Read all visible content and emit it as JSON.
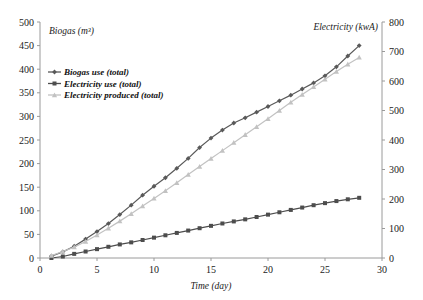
{
  "chart_data": {
    "type": "line",
    "title": "",
    "xlabel": "Time (day)",
    "ylabel": "Biogas (m³)",
    "ylabel_right": "Electricity (kwA)",
    "xlim": [
      0,
      30
    ],
    "ylim": [
      0,
      500
    ],
    "ylim_right": [
      0,
      800
    ],
    "xticks": [
      0,
      5,
      10,
      15,
      20,
      25,
      30
    ],
    "yticks": [
      0,
      50,
      100,
      150,
      200,
      250,
      300,
      350,
      400,
      450,
      500
    ],
    "yticks_right": [
      0,
      100,
      200,
      300,
      400,
      500,
      600,
      700,
      800
    ],
    "grid": false,
    "legend_position": "upper-left",
    "x": [
      1,
      2,
      3,
      4,
      5,
      6,
      7,
      8,
      9,
      10,
      11,
      12,
      13,
      14,
      15,
      16,
      17,
      18,
      19,
      20,
      21,
      22,
      23,
      24,
      25,
      26,
      27,
      28
    ],
    "series": [
      {
        "name": "Biogas use (total)",
        "axis": "left",
        "unit": "m³",
        "color": "#595959",
        "marker": "diamond",
        "values": [
          4,
          13,
          25,
          40,
          56,
          73,
          92,
          112,
          133,
          152,
          170,
          190,
          211,
          234,
          254,
          271,
          286,
          297,
          309,
          321,
          333,
          345,
          358,
          371,
          386,
          405,
          428,
          450
        ]
      },
      {
        "name": "Electricity use (total)",
        "axis": "right",
        "unit": "kwA",
        "color": "#4d4d4d",
        "marker": "square",
        "values": [
          0,
          5,
          14,
          22,
          30,
          38,
          46,
          53,
          61,
          69,
          77,
          85,
          93,
          101,
          109,
          117,
          124,
          131,
          139,
          147,
          155,
          163,
          171,
          179,
          186,
          193,
          199,
          204
        ]
      },
      {
        "name": "Electricity produced (total)",
        "axis": "right",
        "unit": "kwA",
        "color": "#c2c2c2",
        "marker": "triangle",
        "values": [
          8,
          22,
          37,
          56,
          78,
          101,
          125,
          150,
          176,
          202,
          228,
          255,
          283,
          310,
          337,
          364,
          391,
          418,
          445,
          472,
          500,
          528,
          554,
          580,
          606,
          632,
          657,
          680
        ]
      }
    ]
  },
  "axes": {
    "left_title": "Biogas (m³)",
    "right_title": "Electricity (kwA)",
    "x_title": "Time (day)"
  },
  "legend": {
    "items": [
      {
        "label": "Biogas use (total)"
      },
      {
        "label": "Electricity use (total)"
      },
      {
        "label": "Electricity produced (total)"
      }
    ]
  }
}
